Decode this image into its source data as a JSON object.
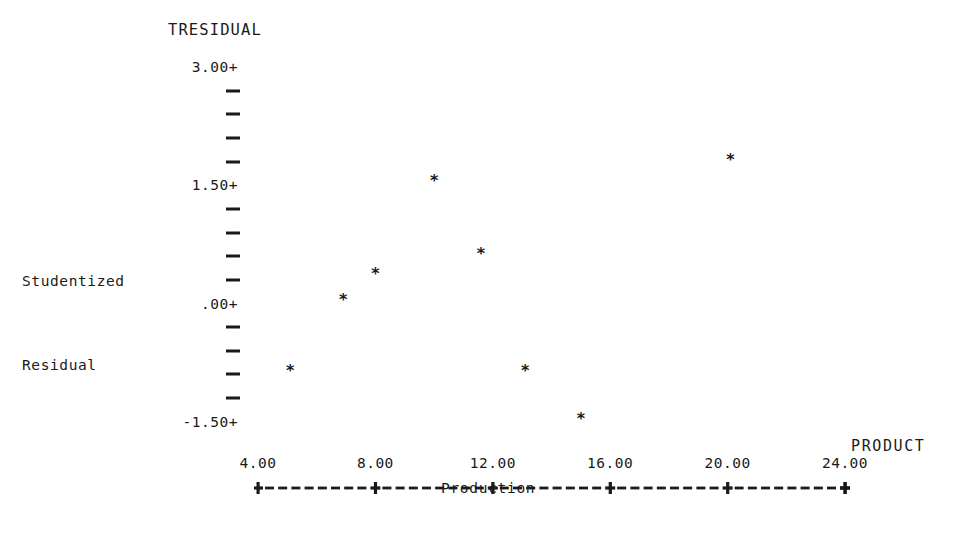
{
  "chart_data": {
    "type": "scatter",
    "title": "TRESIDUAL",
    "xlabel": "Production",
    "ylabel": "Studentized Residual",
    "x_axis_name": "PRODUCT",
    "marker": "*",
    "grid": false,
    "legend": null,
    "xlim": [
      4.0,
      24.0
    ],
    "ylim": [
      -1.5,
      3.0
    ],
    "x_tick_labels": [
      "4.00",
      "8.00",
      "12.00",
      "16.00",
      "20.00",
      "24.00"
    ],
    "x_tick_values": [
      4.0,
      8.0,
      12.0,
      16.0,
      20.0,
      24.0
    ],
    "y_tick_labels": [
      "3.00+",
      "1.50+",
      ".00+",
      "-1.50+"
    ],
    "y_tick_values": [
      3.0,
      1.5,
      0.0,
      -1.5
    ],
    "y_minor_ticks_between": 4,
    "points": [
      {
        "x": 5.1,
        "y": -0.85
      },
      {
        "x": 6.9,
        "y": 0.05
      },
      {
        "x": 8.0,
        "y": 0.37
      },
      {
        "x": 10.0,
        "y": 1.55
      },
      {
        "x": 11.6,
        "y": 0.63
      },
      {
        "x": 13.1,
        "y": -0.85
      },
      {
        "x": 15.0,
        "y": -1.47
      },
      {
        "x": 20.1,
        "y": 1.82
      }
    ]
  },
  "colors": {
    "ink": "#1a1a1a",
    "background": "#ffffff"
  }
}
